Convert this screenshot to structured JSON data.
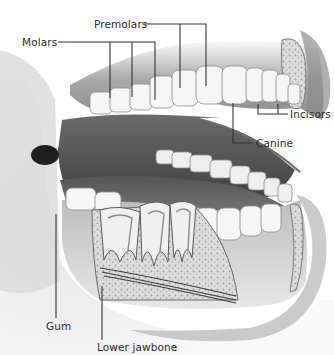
{
  "diagram": {
    "labels": [
      {
        "id": "molars",
        "text": "Molars",
        "x": 22,
        "y": 36
      },
      {
        "id": "premolars",
        "text": "Premolars",
        "x": 94,
        "y": 18
      },
      {
        "id": "incisors",
        "text": "Incisors",
        "x": 290,
        "y": 118
      },
      {
        "id": "canine",
        "text": "Canine",
        "x": 256,
        "y": 138
      },
      {
        "id": "gum",
        "text": "Gum",
        "x": 50,
        "y": 322
      },
      {
        "id": "lower_jawbone",
        "text": "Lower jawbone",
        "x": 97,
        "y": 343
      }
    ],
    "colors": {
      "label_text": "#2a2a2a",
      "leader_line": "#333333",
      "tooth": "#f4f4f4",
      "gum": "#9a9a9a",
      "mouth_interior": "#4a4a4a",
      "bone": "#d6d6d6"
    }
  }
}
